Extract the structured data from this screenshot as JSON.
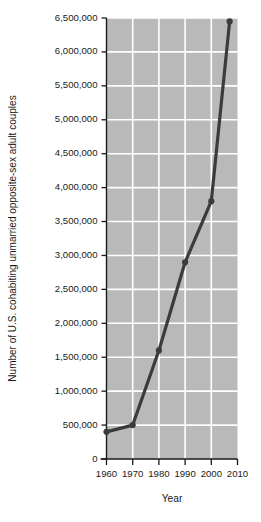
{
  "chart_data": {
    "type": "line",
    "title": "",
    "xlabel": "Year",
    "ylabel": "Number of U.S. cohabiting unmarried opposite-sex adult couples",
    "x": [
      1960,
      1970,
      1980,
      1990,
      2000,
      2007
    ],
    "values": [
      400000,
      500000,
      1600000,
      2900000,
      3800000,
      6450000
    ],
    "series": [
      {
        "name": "U.S. cohabiting unmarried opposite-sex adult couples",
        "values": [
          400000,
          500000,
          1600000,
          2900000,
          3800000,
          6450000
        ]
      }
    ],
    "xlim": [
      1960,
      2010
    ],
    "ylim": [
      0,
      6500000
    ],
    "xticks": [
      1960,
      1970,
      1980,
      1990,
      2000,
      2010
    ],
    "xtick_labels": [
      "1960",
      "1970",
      "1980",
      "1990",
      "2000",
      "2010"
    ],
    "yticks": [
      0,
      500000,
      1000000,
      1500000,
      2000000,
      2500000,
      3000000,
      3500000,
      4000000,
      4500000,
      5000000,
      5500000,
      6000000,
      6500000
    ],
    "ytick_labels": [
      "0",
      "500,000",
      "1,000,000",
      "1,500,000",
      "2,000,000",
      "2,500,000",
      "3,000,000",
      "3,500,000",
      "4,000,000",
      "4,500,000",
      "5,000,000",
      "5,500,000",
      "6,000,000",
      "6,500,000"
    ],
    "grid": true,
    "legend": "none",
    "marker": "circle",
    "colors": {
      "plot_background": "#b9b9b9",
      "gridline": "#ffffff",
      "line": "#3b3b3b",
      "marker": "#3b3b3b",
      "axis": "#1a1a1a",
      "text": "#1a1a1a",
      "figure_background": "#ffffff"
    }
  }
}
